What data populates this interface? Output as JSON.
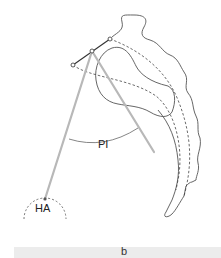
{
  "labels": {
    "pi": "PI",
    "ha": "HA",
    "panel": "b"
  },
  "colors": {
    "outline": "#555555",
    "rod": "#b8b8b8",
    "dashed": "#444444",
    "bar": "#ececec"
  }
}
